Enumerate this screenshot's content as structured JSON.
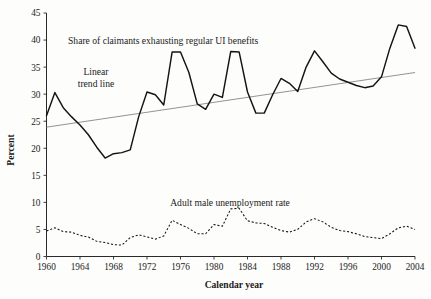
{
  "chart_data": {
    "type": "line",
    "title": "",
    "xlabel": "Calendar year",
    "ylabel": "Percent",
    "xlim": [
      1960,
      2004
    ],
    "ylim": [
      0,
      45
    ],
    "grid": false,
    "legend_position": "inline-annotations",
    "xticks": [
      1960,
      1964,
      1968,
      1972,
      1976,
      1980,
      1984,
      1988,
      1992,
      1996,
      2000,
      2004
    ],
    "yticks": [
      0,
      5,
      10,
      15,
      20,
      25,
      30,
      35,
      40,
      45
    ],
    "x": [
      1960,
      1961,
      1962,
      1963,
      1964,
      1965,
      1966,
      1967,
      1968,
      1969,
      1970,
      1971,
      1972,
      1973,
      1974,
      1975,
      1976,
      1977,
      1978,
      1979,
      1980,
      1981,
      1982,
      1983,
      1984,
      1985,
      1986,
      1987,
      1988,
      1989,
      1990,
      1991,
      1992,
      1993,
      1994,
      1995,
      1996,
      1997,
      1998,
      1999,
      2000,
      2001,
      2002,
      2003,
      2004
    ],
    "series": [
      {
        "name": "Share of claimants exhausting regular UI benefits",
        "style": "solid",
        "values": [
          26.0,
          30.3,
          27.5,
          25.8,
          24.3,
          22.5,
          20.2,
          18.2,
          19.0,
          19.2,
          19.7,
          25.8,
          30.4,
          29.9,
          28.0,
          37.8,
          37.8,
          34.0,
          28.2,
          27.2,
          30.0,
          29.4,
          37.9,
          37.8,
          30.4,
          26.5,
          26.5,
          29.9,
          32.9,
          32.0,
          30.5,
          35.0,
          38.0,
          36.0,
          33.9,
          32.8,
          32.2,
          31.6,
          31.2,
          31.5,
          33.2,
          38.5,
          42.8,
          42.5,
          38.5
        ]
      },
      {
        "name": "Adult male unemployment rate",
        "style": "dotted",
        "values": [
          4.7,
          5.3,
          4.6,
          4.5,
          3.9,
          3.6,
          2.8,
          2.6,
          2.2,
          2.1,
          3.5,
          4.0,
          3.6,
          3.2,
          3.8,
          6.7,
          5.9,
          5.2,
          4.2,
          4.2,
          5.9,
          5.6,
          8.8,
          8.9,
          6.6,
          6.2,
          6.1,
          5.4,
          4.8,
          4.5,
          5.0,
          6.4,
          7.0,
          6.4,
          5.4,
          4.8,
          4.6,
          4.2,
          3.7,
          3.5,
          3.3,
          4.2,
          5.3,
          5.6,
          5.0
        ]
      }
    ],
    "trend_line": {
      "name": "Linear trend line",
      "style": "thin-gray",
      "start": {
        "x": 1960,
        "y": 23.9
      },
      "end": {
        "x": 2004,
        "y": 34.0
      }
    },
    "annotations": [
      {
        "id": "ui-label",
        "text": "Share of claimants exhausting regular UI benefits"
      },
      {
        "id": "trend-label-1",
        "text": "Linear"
      },
      {
        "id": "trend-label-2",
        "text": "trend line"
      },
      {
        "id": "unemp-label",
        "text": "Adult male unemployment rate"
      }
    ]
  }
}
